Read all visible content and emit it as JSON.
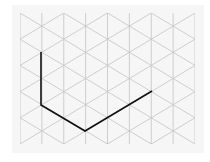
{
  "diagram": {
    "type": "isometric-grid",
    "background": "#f6f6f6",
    "grid_color": "#c8c8c8",
    "path_color": "#111111",
    "grid": {
      "x_left": 20,
      "x_right": 195,
      "y_top": 13,
      "y_bottom": 144,
      "column_spacing": 21.875,
      "row_half_step": 13.1
    },
    "path": {
      "points": [
        [
          41,
          52
        ],
        [
          41,
          105
        ],
        [
          85,
          131
        ],
        [
          152,
          91
        ]
      ],
      "segments": [
        {
          "direction": "vertical-down",
          "length_units": 2
        },
        {
          "direction": "down-right",
          "length_units": 2
        },
        {
          "direction": "up-right",
          "length_units": 3
        }
      ]
    }
  }
}
